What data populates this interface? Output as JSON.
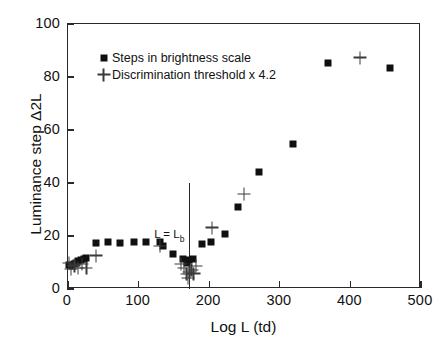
{
  "chart_data": {
    "type": "scatter",
    "title": "",
    "xlabel": "Log L (td)",
    "ylabel": "Luminance step Δ2L",
    "xlim": [
      0,
      500
    ],
    "ylim": [
      0,
      100
    ],
    "xticks": [
      0,
      100,
      200,
      300,
      400,
      500
    ],
    "yticks": [
      0,
      20,
      40,
      60,
      80,
      100
    ],
    "grid": false,
    "legend_position": "top-left",
    "annotations": [
      {
        "name": "l-equals-lb",
        "text": "L = L",
        "subscript": "b",
        "x": 172,
        "line_y_from": 0,
        "line_y_to": 40
      }
    ],
    "series": [
      {
        "name": "Steps in brightness scale",
        "marker": "square",
        "color": "#101010",
        "points": [
          [
            2,
            9.0
          ],
          [
            5,
            8.6
          ],
          [
            8,
            9.6
          ],
          [
            11,
            10.0
          ],
          [
            14,
            10.4
          ],
          [
            18,
            10.8
          ],
          [
            22,
            11.2
          ],
          [
            26,
            11.6
          ],
          [
            40,
            17.3
          ],
          [
            56,
            17.6
          ],
          [
            74,
            17.5
          ],
          [
            93,
            17.6
          ],
          [
            111,
            17.7
          ],
          [
            130,
            17.6
          ],
          [
            135,
            16.3
          ],
          [
            149,
            13.3
          ],
          [
            163,
            11.2
          ],
          [
            168,
            9.7
          ],
          [
            172,
            10.8
          ],
          [
            177,
            11.2
          ],
          [
            190,
            17.0
          ],
          [
            203,
            17.7
          ],
          [
            222,
            20.8
          ],
          [
            241,
            31.1
          ],
          [
            270,
            44.2
          ],
          [
            318,
            54.9
          ],
          [
            368,
            85.2
          ],
          [
            456,
            83.3
          ]
        ]
      },
      {
        "name": "Discrimination threshold x 4.2",
        "marker": "plus",
        "color": "#3a3a3a",
        "points": [
          [
            1,
            9.8
          ],
          [
            4,
            7.6
          ],
          [
            9,
            8.8
          ],
          [
            14,
            8.0
          ],
          [
            20,
            9.4
          ],
          [
            26,
            8.0
          ],
          [
            40,
            12.6
          ],
          [
            130,
            16.3
          ],
          [
            160,
            9.4
          ],
          [
            164,
            8.0
          ],
          [
            168,
            5.6
          ],
          [
            170,
            4.2
          ],
          [
            172,
            6.4
          ],
          [
            175,
            7.2
          ],
          [
            178,
            5.8
          ],
          [
            181,
            8.6
          ],
          [
            204,
            23.2
          ],
          [
            249,
            35.8
          ],
          [
            414,
            87.3
          ]
        ]
      }
    ]
  },
  "legend": {
    "items": [
      {
        "label": "Steps in brightness scale",
        "marker": "square"
      },
      {
        "label": "Discrimination threshold x 4.2",
        "marker": "plus"
      }
    ]
  },
  "axis_titles": {
    "x": "Log L (td)",
    "y": "Luminance step Δ2L"
  }
}
